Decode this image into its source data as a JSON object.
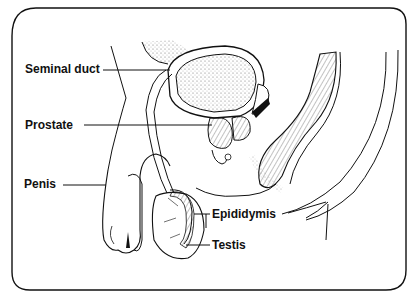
{
  "diagram": {
    "type": "anatomical-illustration",
    "labels": [
      {
        "id": "seminal-duct",
        "text": "Seminal duct"
      },
      {
        "id": "prostate",
        "text": "Prostate"
      },
      {
        "id": "penis",
        "text": "Penis"
      },
      {
        "id": "epididymis",
        "text": "Epididymis"
      },
      {
        "id": "testis",
        "text": "Testis"
      }
    ],
    "colors": {
      "line": "#111111",
      "background": "#ffffff",
      "stipple": "#555555"
    }
  }
}
